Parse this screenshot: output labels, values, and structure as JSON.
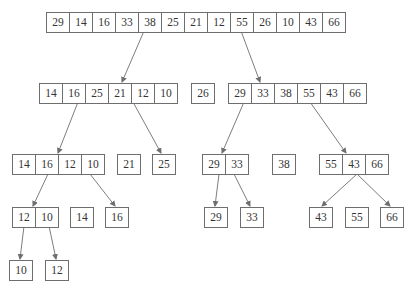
{
  "colors": {
    "line": "#6e6e6e",
    "text": "#333333",
    "background": "#ffffff"
  },
  "nodes": [
    {
      "id": "root",
      "values": [
        "29",
        "14",
        "16",
        "33",
        "38",
        "25",
        "21",
        "12",
        "55",
        "26",
        "10",
        "43",
        "66"
      ],
      "x": 46,
      "y": 12
    },
    {
      "id": "l1",
      "values": [
        "14",
        "16",
        "25",
        "21",
        "12",
        "10"
      ],
      "x": 39,
      "y": 83
    },
    {
      "id": "m1",
      "values": [
        "26"
      ],
      "x": 191,
      "y": 83
    },
    {
      "id": "r1",
      "values": [
        "29",
        "33",
        "38",
        "55",
        "43",
        "66"
      ],
      "x": 228,
      "y": 83
    },
    {
      "id": "l2",
      "values": [
        "14",
        "16",
        "12",
        "10"
      ],
      "x": 12,
      "y": 154
    },
    {
      "id": "l2b",
      "values": [
        "21"
      ],
      "x": 117,
      "y": 154
    },
    {
      "id": "l2c",
      "values": [
        "25"
      ],
      "x": 152,
      "y": 154
    },
    {
      "id": "r2a",
      "values": [
        "29",
        "33"
      ],
      "x": 202,
      "y": 154
    },
    {
      "id": "r2b",
      "values": [
        "38"
      ],
      "x": 272,
      "y": 154
    },
    {
      "id": "r2c",
      "values": [
        "55",
        "43",
        "66"
      ],
      "x": 319,
      "y": 154
    },
    {
      "id": "l3a",
      "values": [
        "12",
        "10"
      ],
      "x": 12,
      "y": 207
    },
    {
      "id": "l3b",
      "values": [
        "14"
      ],
      "x": 70,
      "y": 207
    },
    {
      "id": "l3c",
      "values": [
        "16"
      ],
      "x": 105,
      "y": 207
    },
    {
      "id": "r3a",
      "values": [
        "29"
      ],
      "x": 204,
      "y": 207
    },
    {
      "id": "r3b",
      "values": [
        "33"
      ],
      "x": 240,
      "y": 207
    },
    {
      "id": "r3c",
      "values": [
        "43"
      ],
      "x": 309,
      "y": 207
    },
    {
      "id": "r3d",
      "values": [
        "55"
      ],
      "x": 345,
      "y": 207
    },
    {
      "id": "r3e",
      "values": [
        "66"
      ],
      "x": 380,
      "y": 207
    },
    {
      "id": "l4a",
      "values": [
        "10"
      ],
      "x": 9,
      "y": 260
    },
    {
      "id": "l4b",
      "values": [
        "12"
      ],
      "x": 45,
      "y": 260
    }
  ],
  "edges": [
    {
      "from": [
        144,
        31
      ],
      "to": [
        122,
        82
      ]
    },
    {
      "from": [
        241,
        31
      ],
      "to": [
        260,
        82
      ]
    },
    {
      "from": [
        78,
        102
      ],
      "to": [
        58,
        153
      ]
    },
    {
      "from": [
        133,
        102
      ],
      "to": [
        161,
        153
      ]
    },
    {
      "from": [
        244,
        102
      ],
      "to": [
        222,
        153
      ]
    },
    {
      "from": [
        310,
        102
      ],
      "to": [
        346,
        153
      ]
    },
    {
      "from": [
        48,
        174
      ],
      "to": [
        33,
        206
      ]
    },
    {
      "from": [
        90,
        174
      ],
      "to": [
        115,
        206
      ]
    },
    {
      "from": [
        219,
        174
      ],
      "to": [
        215,
        206
      ]
    },
    {
      "from": [
        234,
        174
      ],
      "to": [
        250,
        206
      ]
    },
    {
      "from": [
        357,
        174
      ],
      "to": [
        322,
        206
      ]
    },
    {
      "from": [
        357,
        174
      ],
      "to": [
        390,
        206
      ]
    },
    {
      "from": [
        24,
        226
      ],
      "to": [
        20,
        259
      ]
    },
    {
      "from": [
        49,
        226
      ],
      "to": [
        56,
        259
      ]
    }
  ]
}
